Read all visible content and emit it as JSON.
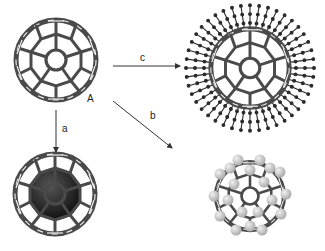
{
  "figure": {
    "colors": {
      "cage": "#4a4a4a",
      "cage_light": "#d8d8d8",
      "arrow": "#333333",
      "chain_atom": "#2a2a2a",
      "endohedral_core": "#151515",
      "adatom": "#c8c8c8"
    },
    "structures": [
      {
        "id": "A",
        "description": "C60 fullerene cage",
        "label": "A"
      },
      {
        "id": "endohedral",
        "description": "fullerene with encapsulated species (dark sphere)"
      },
      {
        "id": "exohedral_chains",
        "description": "fullerene with radially attached chains"
      },
      {
        "id": "exohedral_atoms",
        "description": "fullerene with atoms bonded to surface"
      }
    ],
    "arrows": [
      {
        "id": "a",
        "label": "a",
        "from": "A",
        "to": "endohedral",
        "direction": "down"
      },
      {
        "id": "b",
        "label": "b",
        "from": "A",
        "to": "exohedral_atoms",
        "direction": "diagonal-down-right"
      },
      {
        "id": "c",
        "label": "c",
        "from": "A",
        "to": "exohedral_chains",
        "direction": "right"
      }
    ]
  }
}
